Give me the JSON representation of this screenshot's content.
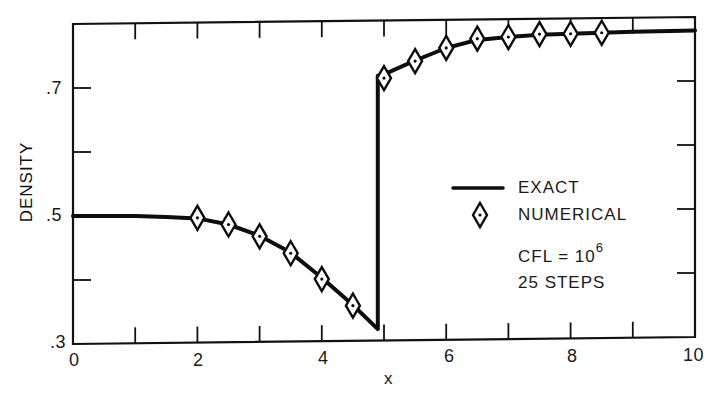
{
  "chart_data": {
    "type": "line",
    "title": "",
    "xlabel": "x",
    "ylabel": "DENSITY",
    "xlim": [
      0,
      10
    ],
    "ylim": [
      0.3,
      0.8
    ],
    "grid": false,
    "x_ticks": [
      0,
      1,
      2,
      3,
      4,
      5,
      6,
      7,
      8,
      9,
      10
    ],
    "x_tick_labels": [
      "0",
      "2",
      "4",
      "6",
      "8",
      "10"
    ],
    "x_tick_label_values": [
      0,
      2,
      4,
      6,
      8,
      10
    ],
    "y_ticks": [
      0.3,
      0.4,
      0.5,
      0.6,
      0.7,
      0.8
    ],
    "y_tick_labels": [
      ".3",
      ".5",
      ".7"
    ],
    "y_tick_label_values": [
      0.3,
      0.5,
      0.7
    ],
    "legend_position": "center-right",
    "series": [
      {
        "name": "EXACT",
        "style": "solid-line",
        "x": [
          0,
          1,
          1.5,
          2,
          2.5,
          3,
          3.5,
          4,
          4.5,
          4.9,
          4.9,
          5,
          5.5,
          6,
          6.5,
          7,
          7.5,
          8,
          8.5,
          9,
          10
        ],
        "y": [
          0.5,
          0.499,
          0.497,
          0.494,
          0.484,
          0.466,
          0.439,
          0.399,
          0.356,
          0.318,
          0.714,
          0.716,
          0.737,
          0.756,
          0.768,
          0.772,
          0.775,
          0.776,
          0.777,
          0.778,
          0.779
        ]
      },
      {
        "name": "NUMERICAL",
        "style": "diamond-markers",
        "x": [
          2,
          2.5,
          3,
          3.5,
          4,
          4.5,
          5,
          5.5,
          6,
          6.5,
          7,
          7.5,
          8,
          8.5
        ],
        "y": [
          0.495,
          0.484,
          0.465,
          0.438,
          0.397,
          0.355,
          0.71,
          0.736,
          0.756,
          0.77,
          0.772,
          0.776,
          0.776,
          0.777
        ]
      }
    ],
    "annotations": [
      "CFL = 10^6",
      "25 STEPS"
    ]
  },
  "axes": {
    "xlabel": "x",
    "ylabel": "DENSITY",
    "x_labels": [
      "0",
      "2",
      "4",
      "6",
      "8",
      "10"
    ],
    "y_labels": [
      ".3",
      ".5",
      ".7"
    ]
  },
  "legend": {
    "exact_label": "EXACT",
    "numerical_label": "NUMERICAL",
    "cfl_prefix": "CFL = 10",
    "cfl_exponent": "6",
    "steps": "25 STEPS"
  }
}
